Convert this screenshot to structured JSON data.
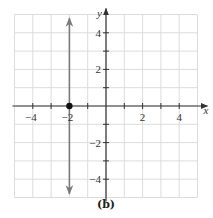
{
  "chart_data": {
    "type": "line",
    "title": "",
    "caption": "(b)",
    "xlabel": "x",
    "ylabel": "y",
    "xlim": [
      -5,
      5
    ],
    "ylim": [
      -5,
      5
    ],
    "grid": true,
    "x_ticks": [
      -4,
      -2,
      2,
      4
    ],
    "y_ticks": [
      4,
      2,
      -2,
      -4
    ],
    "x_tick_labels": [
      "−4",
      "−2",
      "2",
      "4"
    ],
    "y_tick_labels": [
      "4",
      "2",
      "−2",
      "−4"
    ],
    "series": [
      {
        "name": "vertical line x = -2",
        "kind": "vertical_line",
        "x": -2,
        "y_range": [
          -4.8,
          4.8
        ],
        "arrows": "both",
        "color": "#7a7a7a"
      }
    ],
    "points": [
      {
        "x": -2,
        "y": 0,
        "style": "filled",
        "color": "#111111"
      }
    ],
    "colors": {
      "grid": "#dcdcdc",
      "axis": "#333333",
      "line": "#7a7a7a",
      "point": "#111111"
    }
  }
}
